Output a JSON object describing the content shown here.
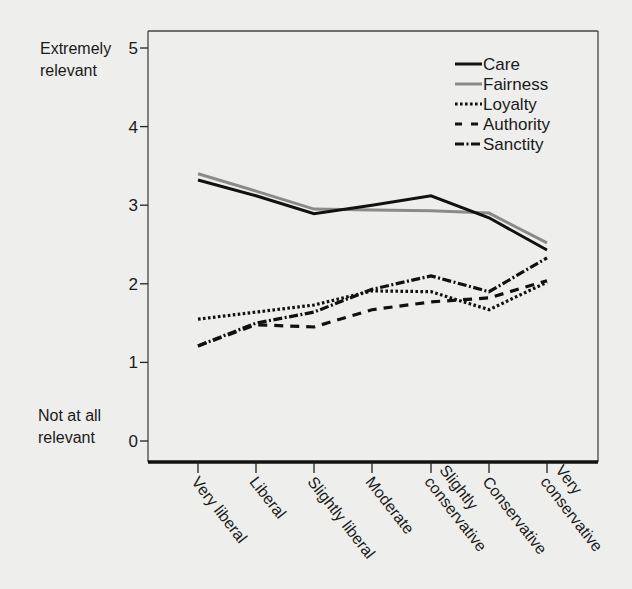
{
  "chart_data": {
    "type": "line",
    "title": "",
    "xlabel": "",
    "ylabel": "",
    "ylim": [
      0,
      5
    ],
    "yticks": [
      0,
      1,
      2,
      3,
      4,
      5
    ],
    "y_anchor_labels": {
      "top": [
        "Extremely",
        "relevant"
      ],
      "bottom": [
        "Not at all",
        "relevant"
      ]
    },
    "categories": [
      "Very liberal",
      "Liberal",
      "Slightly liberal",
      "Moderate",
      "Slightly conservative",
      "Conservative",
      "Very conservative"
    ],
    "category_label_lines": [
      [
        "Very liberal"
      ],
      [
        "Liberal"
      ],
      [
        "Slightly liberal"
      ],
      [
        "Moderate"
      ],
      [
        "Slightly",
        "conservative"
      ],
      [
        "Conservative"
      ],
      [
        "Very",
        "conservative"
      ]
    ],
    "series": [
      {
        "name": "Care",
        "style": "solid",
        "color": "#111111",
        "values": [
          3.32,
          3.12,
          2.89,
          3.0,
          3.12,
          2.84,
          2.43
        ]
      },
      {
        "name": "Fairness",
        "style": "solid",
        "color": "#8a8a8a",
        "values": [
          3.4,
          3.18,
          2.95,
          2.94,
          2.93,
          2.9,
          2.52
        ]
      },
      {
        "name": "Loyalty",
        "style": "dotted",
        "color": "#111111",
        "values": [
          1.55,
          1.64,
          1.73,
          1.91,
          1.9,
          1.67,
          2.02
        ]
      },
      {
        "name": "Authority",
        "style": "dashed",
        "color": "#111111",
        "values": [
          1.21,
          1.48,
          1.45,
          1.67,
          1.77,
          1.82,
          2.04
        ]
      },
      {
        "name": "Sanctity",
        "style": "dashdot",
        "color": "#111111",
        "values": [
          1.21,
          1.5,
          1.64,
          1.93,
          2.1,
          1.9,
          2.33
        ]
      }
    ],
    "legend": {
      "position": "upper right",
      "entries": [
        "Care",
        "Fairness",
        "Loyalty",
        "Authority",
        "Sanctity"
      ]
    },
    "grid": false
  }
}
